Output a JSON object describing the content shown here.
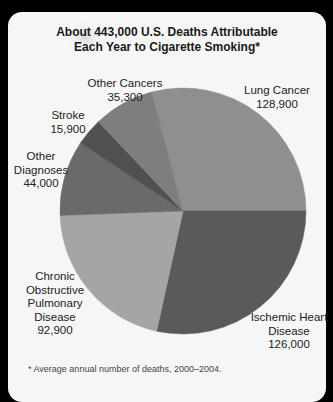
{
  "chart_data": {
    "type": "pie",
    "title": "About 443,000 U.S. Deaths Attributable Each Year to Cigarette Smoking*",
    "title_lines": [
      "About 443,000 U.S. Deaths Attributable",
      "Each Year to Cigarette Smoking*"
    ],
    "total": 443000,
    "categories": [
      "Lung Cancer",
      "Ischemic Heart Disease",
      "Chronic Obstructive Pulmonary Disease",
      "Other Diagnoses",
      "Stroke",
      "Other Cancers"
    ],
    "values": [
      128900,
      126000,
      92900,
      44000,
      15900,
      35300
    ],
    "value_labels": [
      "128,900",
      "126,000",
      "92,900",
      "44,000",
      "15,900",
      "35,300"
    ],
    "colors": [
      "#8f8f8f",
      "#5a5a5a",
      "#a5a5a5",
      "#6a6a6a",
      "#505050",
      "#7e7e7e"
    ],
    "start_angle_deg": -14.75,
    "direction": "clockwise",
    "legend": "none (direct labels)",
    "footnote": "* Average annual number of deaths, 2000–2004."
  },
  "labels": {
    "lung": {
      "lines": [
        "Lung Cancer"
      ],
      "value": "128,900"
    },
    "ihd": {
      "lines": [
        "Ischemic Heart",
        "Disease"
      ],
      "value": "126,000"
    },
    "copd": {
      "lines": [
        "Chronic",
        "Obstructive",
        "Pulmonary",
        "Disease"
      ],
      "value": "92,900"
    },
    "other_diagnoses": {
      "lines": [
        "Other",
        "Diagnoses"
      ],
      "value": "44,000"
    },
    "stroke": {
      "lines": [
        "Stroke"
      ],
      "value": "15,900"
    },
    "other_cancers": {
      "lines": [
        "Other Cancers"
      ],
      "value": "35,300"
    }
  }
}
